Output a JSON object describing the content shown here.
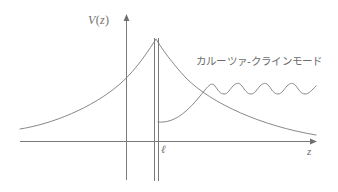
{
  "figure": {
    "kind": "potential-diagram",
    "width": 338,
    "height": 192,
    "background": "#ffffff",
    "stroke_color": "#7a7a7a",
    "text_color": "#6f6f6f"
  },
  "axes": {
    "vertical": {
      "label": "V (z)",
      "label_prefix": "V",
      "label_open": "(",
      "label_var": "z",
      "label_close": ")",
      "x_px": 126,
      "top_px": 15,
      "bottom_px": 180,
      "arrow": "up"
    },
    "horizontal": {
      "label": "z",
      "y_px": 141,
      "left_px": 20,
      "right_px": 316,
      "arrow": "right"
    }
  },
  "markers": {
    "brane": {
      "label": "ℓ",
      "name": "brane-double-line",
      "x1_px": 154,
      "x2_px": 159,
      "top_px": 38,
      "bottom_px": 180
    }
  },
  "annotations": [
    {
      "name": "kaluza-klein-mode-label",
      "text": "カルーツァ-クラインモード",
      "x_px": 196,
      "y_px": 56
    }
  ],
  "chart_data": {
    "type": "line",
    "title": "",
    "xlabel": "z",
    "ylabel": "V (z)",
    "grid": false,
    "legend": "none",
    "xlim": [
      0,
      338
    ],
    "ylim": [
      0,
      192
    ],
    "annotations": [
      "カルーツァ-クラインモード"
    ],
    "tick_labels": {
      "x": [
        "ℓ"
      ],
      "y": []
    },
    "series": [
      {
        "name": "potential-V",
        "description": "Warped potential V(z) peaking at the brane z = l and decaying on both sides",
        "path": "M 20 129 C 52 124 92 108 120 84 C 138 68 150 48 156 39 C 162 49 172 63 186 78 C 212 104 262 126 316 135"
      },
      {
        "name": "kaluza-klein-mode",
        "description": "Kaluza-Klein mode wavefunction: suppressed near the brane, rising and oscillating at large z",
        "path": "M 158 122 C 166 123 176 120 186 111 C 194 104 200 96 205 90 C 209 85 212 82 215 86 C 218 90 220 94 224 94 C 228 94 230 89 233 86 C 236 83 239 82 242 86 C 245 90 247 94 251 94 C 255 94 257 89 260 86 C 263 83 266 82 269 86 C 272 90 274 94 278 94 C 282 94 284 89 287 86 C 290 83 293 82 296 86 C 299 90 301 94 305 94 C 309 94 312 90 316 86",
        "oscillation_cycles": 4.5,
        "amplitude_px": 5
      }
    ]
  }
}
